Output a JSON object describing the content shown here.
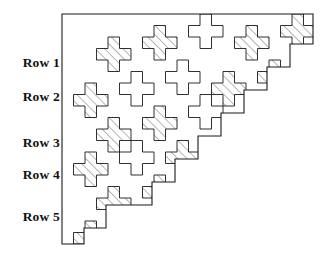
{
  "figure": {
    "kind": "tessellation-diagram",
    "colors": {
      "background": "#ffffff",
      "outline": "#1a1a1a",
      "hatch": "#555555",
      "label": "#111111"
    },
    "geometry": {
      "origin_x": 62,
      "origin_y": 14,
      "cell": 11.5,
      "cols": 22,
      "rows": 20,
      "shape": "right-triangle-staircase",
      "hatch_angle_deg": 45,
      "hatch_spacing_px": 4.6,
      "hatch_line_width_px": 0.8,
      "outline_width_px": 0.9
    },
    "outline_points": "62,14 313,14 313,44 290,44 290,67 267,67 267,90 244,90 244,113 221,113 221,136 198,136 198,159 175,159 175,182 152,182 152,205 106,205 106,228 84,228 84,244 62,244",
    "tiles": [
      {
        "cx": 3,
        "cy": 2,
        "shaded": true
      },
      {
        "cx": 7,
        "cy": 1,
        "shaded": true
      },
      {
        "cx": 11,
        "cy": 0,
        "shaded": false
      },
      {
        "cx": 15,
        "cy": 1,
        "shaded": true
      },
      {
        "cx": 19,
        "cy": 0,
        "shaded": true
      },
      {
        "cx": 1,
        "cy": 6,
        "shaded": true
      },
      {
        "cx": 5,
        "cy": 5,
        "shaded": false
      },
      {
        "cx": 9,
        "cy": 4,
        "shaded": false
      },
      {
        "cx": 13,
        "cy": 5,
        "shaded": true
      },
      {
        "cx": 17,
        "cy": 4,
        "shaded": true
      },
      {
        "cx": 3,
        "cy": 9,
        "shaded": true
      },
      {
        "cx": 7,
        "cy": 8,
        "shaded": true
      },
      {
        "cx": 11,
        "cy": 7,
        "shaded": false
      },
      {
        "cx": 15,
        "cy": 8,
        "shaded": true
      },
      {
        "cx": 1,
        "cy": 12,
        "shaded": true
      },
      {
        "cx": 5,
        "cy": 11,
        "shaded": false
      },
      {
        "cx": 9,
        "cy": 11,
        "shaded": true
      },
      {
        "cx": 13,
        "cy": 11,
        "shaded": true
      },
      {
        "cx": 3,
        "cy": 15,
        "shaded": true
      },
      {
        "cx": 7,
        "cy": 14,
        "shaded": true
      },
      {
        "cx": 1,
        "cy": 18,
        "shaded": true
      }
    ]
  },
  "labels": {
    "rows": [
      {
        "text": "Row 1",
        "y": 56
      },
      {
        "text": "Row 2",
        "y": 90
      },
      {
        "text": "Row 3",
        "y": 136
      },
      {
        "text": "Row 4",
        "y": 168
      },
      {
        "text": "Row 5",
        "y": 210
      }
    ]
  }
}
